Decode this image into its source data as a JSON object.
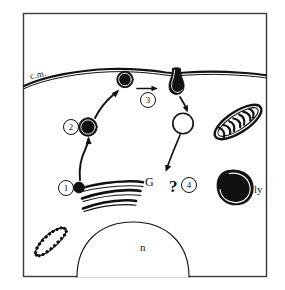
{
  "figure": {
    "border_color": "#3a3a3a",
    "ink_color": "#111111",
    "background_color": "#ffffff"
  },
  "labels": {
    "cell_membrane": "c.m.",
    "golgi": "G",
    "lysosome": "ly",
    "nucleus": "n",
    "unknown_marker": "?"
  },
  "steps": [
    {
      "id": "step-1",
      "number": "1"
    },
    {
      "id": "step-2",
      "number": "2"
    },
    {
      "id": "step-3",
      "number": "3"
    },
    {
      "id": "step-4",
      "number": "4"
    }
  ],
  "structures": [
    {
      "name": "cell-membrane",
      "label": "c.m."
    },
    {
      "name": "golgi-apparatus",
      "label": "G"
    },
    {
      "name": "lysosome",
      "label": "ly"
    },
    {
      "name": "nucleus",
      "label": "n"
    },
    {
      "name": "mitochondrion",
      "label": ""
    },
    {
      "name": "rough-endoplasmic-reticulum",
      "label": ""
    },
    {
      "name": "dark-vesicle-golgi",
      "label": ""
    },
    {
      "name": "dark-vesicle-midway",
      "label": ""
    },
    {
      "name": "dark-vesicle-membrane",
      "label": ""
    },
    {
      "name": "membrane-invagination-pit",
      "label": ""
    },
    {
      "name": "clear-vesicle",
      "label": ""
    }
  ]
}
